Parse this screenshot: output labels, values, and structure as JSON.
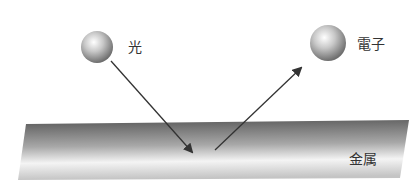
{
  "diagram": {
    "labels": {
      "light": "光",
      "electron": "電子",
      "metal": "金属"
    },
    "colors": {
      "arrow": "#333333",
      "text": "#333333",
      "slab_dark": "#5a5a5a",
      "slab_light": "#f2f2f2",
      "sphere_light": "#ffffff",
      "sphere_dark": "#6e6e6e"
    }
  }
}
